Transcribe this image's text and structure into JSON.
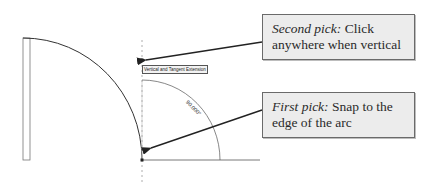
{
  "diagram": {
    "tooltip": "Vertical and Tangent Extension",
    "angle_label": "90.000°",
    "callouts": [
      {
        "emphasis": "Second pick:",
        "text": " Click anywhere when vertical"
      },
      {
        "emphasis": "First pick:",
        "text": " Snap to the edge of the arc"
      }
    ],
    "colors": {
      "line": "#333333",
      "callout_bg": "#ececec",
      "callout_border": "#6a6a6a"
    }
  }
}
